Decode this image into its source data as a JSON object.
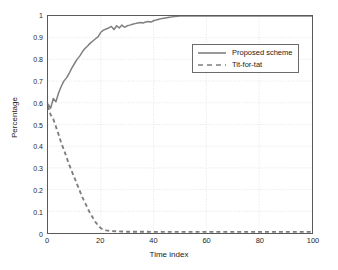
{
  "chart_data": {
    "type": "line",
    "title": "",
    "xlabel": "Time index",
    "ylabel": "Percentage",
    "xlim": [
      0,
      100
    ],
    "ylim": [
      0,
      1
    ],
    "xticks": [
      "0",
      "20",
      "40",
      "60",
      "80",
      "100"
    ],
    "xtick_values": [
      0,
      20,
      40,
      60,
      80,
      100
    ],
    "yticks": [
      "0",
      "0.1",
      "0.2",
      "0.3",
      "0.4",
      "0.5",
      "0.6",
      "0.7",
      "0.8",
      "0.9",
      "1"
    ],
    "ytick_values": [
      0,
      0.1,
      0.2,
      0.3,
      0.4,
      0.5,
      0.6,
      0.7,
      0.8,
      0.9,
      1
    ],
    "grid": true,
    "grid_style": "dotted",
    "grid_color": "#d9d9d9",
    "legend_position": "upper right",
    "line_color": "#7f7f7f",
    "axis_color": "#5a5a5a",
    "series": [
      {
        "name": "Proposed scheme",
        "style": "solid",
        "color": "#7f7f7f",
        "x": [
          0,
          1,
          2,
          3,
          4,
          5,
          6,
          7,
          8,
          9,
          10,
          11,
          12,
          13,
          14,
          15,
          16,
          17,
          18,
          19,
          20,
          21,
          22,
          23,
          24,
          25,
          26,
          27,
          28,
          29,
          30,
          31,
          32,
          33,
          34,
          35,
          36,
          37,
          38,
          39,
          40,
          41,
          42,
          43,
          44,
          45,
          46,
          47,
          48,
          49,
          50,
          55,
          60,
          65,
          70,
          75,
          80,
          85,
          90,
          95,
          100
        ],
        "values": [
          0.595,
          0.575,
          0.62,
          0.605,
          0.645,
          0.675,
          0.7,
          0.715,
          0.735,
          0.76,
          0.78,
          0.8,
          0.815,
          0.835,
          0.85,
          0.862,
          0.875,
          0.885,
          0.895,
          0.905,
          0.925,
          0.935,
          0.94,
          0.945,
          0.952,
          0.938,
          0.955,
          0.945,
          0.958,
          0.948,
          0.955,
          0.958,
          0.962,
          0.965,
          0.968,
          0.97,
          0.968,
          0.972,
          0.975,
          0.972,
          0.978,
          0.982,
          0.985,
          0.988,
          0.99,
          0.992,
          0.994,
          0.996,
          0.998,
          0.999,
          1.0,
          1.0,
          1.0,
          1.0,
          1.0,
          1.0,
          1.0,
          1.0,
          1.0,
          1.0,
          1.0
        ]
      },
      {
        "name": "Tit-for-tat",
        "style": "dashed",
        "color": "#7f7f7f",
        "x": [
          0,
          1,
          2,
          3,
          4,
          5,
          6,
          7,
          8,
          9,
          10,
          11,
          12,
          13,
          14,
          15,
          16,
          17,
          18,
          19,
          20,
          21,
          22,
          24,
          26,
          28,
          30,
          35,
          40,
          45,
          50,
          60,
          70,
          80,
          90,
          100
        ],
        "values": [
          0.585,
          0.545,
          0.525,
          0.49,
          0.455,
          0.415,
          0.385,
          0.35,
          0.315,
          0.285,
          0.255,
          0.225,
          0.195,
          0.165,
          0.14,
          0.115,
          0.09,
          0.07,
          0.05,
          0.035,
          0.022,
          0.016,
          0.012,
          0.009,
          0.008,
          0.007,
          0.006,
          0.006,
          0.005,
          0.005,
          0.005,
          0.005,
          0.005,
          0.005,
          0.005,
          0.005
        ]
      }
    ]
  },
  "legend": {
    "items": [
      {
        "label": "Proposed scheme",
        "style": "solid"
      },
      {
        "label": "Tit-for-tat",
        "style": "dashed"
      }
    ]
  }
}
